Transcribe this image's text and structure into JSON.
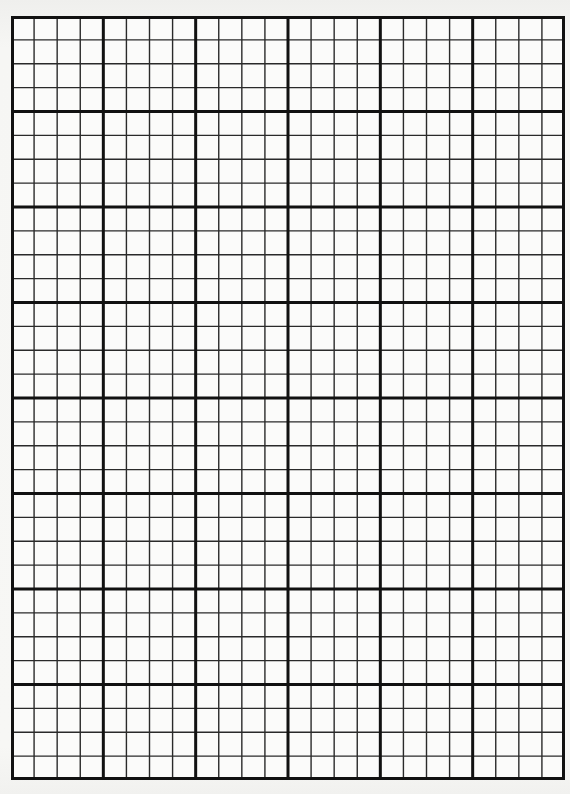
{
  "sheet": {
    "type": "graph-paper",
    "major_columns": 6,
    "major_rows": 8,
    "minor_per_major": 4,
    "colors": {
      "paper": "#f6f6f4",
      "grid_line": "#2a2a2a",
      "major_line": "#111111"
    }
  }
}
